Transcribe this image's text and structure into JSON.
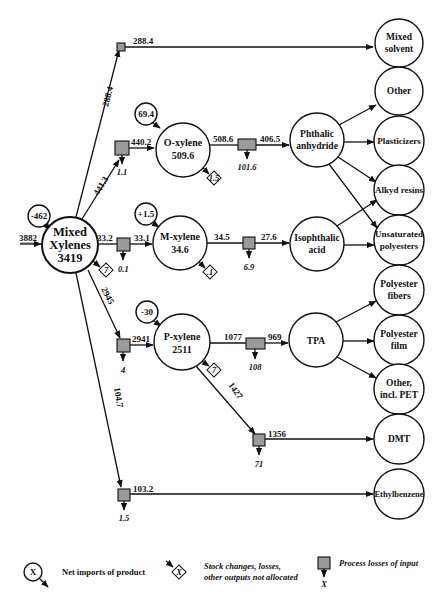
{
  "source_node": {
    "label_line1": "Mixed",
    "label_line2": "Xylenes",
    "value": "3419",
    "input": "3882",
    "net_import": "-462",
    "stock_change": "7"
  },
  "isomers": [
    {
      "name": "O-xylene",
      "value": "509.6",
      "net_import": "69.4",
      "inflow": "441.3",
      "after_loss": "440.2",
      "loss": "1.1",
      "stock_change": "1.5",
      "outflow": "508.6",
      "after_outflow_loss": "406.5",
      "outflow_loss": "101.6"
    },
    {
      "name": "M-xylene",
      "value": "34.6",
      "net_import": "+1.5",
      "inflow": "33.2",
      "after_loss": "33.1",
      "loss": "0.1",
      "stock_change": ".1",
      "outflow": "34.5",
      "after_outflow_loss": "27.6",
      "outflow_loss": "6.9"
    },
    {
      "name": "P-xylene",
      "value": "2511",
      "net_import": "-30",
      "inflow": "2945",
      "after_loss": "2941",
      "loss": "4",
      "stock_change": "7",
      "outflow": "1077",
      "after_outflow_loss": "969",
      "outflow_loss": "108",
      "outflow2": "1427",
      "after_outflow2_loss": "1356",
      "outflow2_loss": "71"
    }
  ],
  "direct_flows": {
    "mixed_solvent": {
      "flow": "288.4",
      "after_loss": "288.4"
    },
    "ethylbenzene": {
      "flow": "104.7",
      "after_loss": "103.2",
      "loss": "1.5"
    }
  },
  "intermediates": {
    "phthalic": {
      "line1": "Phthalic",
      "line2": "anhydride"
    },
    "isophthalic": {
      "line1": "Isophthalic",
      "line2": "acid"
    },
    "tpa": {
      "line1": "TPA"
    }
  },
  "end_uses": [
    {
      "line1": "Mixed",
      "line2": "solvent"
    },
    {
      "line1": "Other",
      "line2": ""
    },
    {
      "line1": "Plasticizers",
      "line2": ""
    },
    {
      "line1": "Alkyd resins",
      "line2": ""
    },
    {
      "line1": "Unsaturated",
      "line2": "polyesters"
    },
    {
      "line1": "Polyester",
      "line2": "fibers"
    },
    {
      "line1": "Polyester",
      "line2": "film"
    },
    {
      "line1": "Other,",
      "line2": "incl. PET"
    },
    {
      "line1": "DMT",
      "line2": ""
    },
    {
      "line1": "Ethylbenzene",
      "line2": ""
    }
  ],
  "legend": {
    "net_imports": {
      "symbol": "X",
      "label": "Net imports of product"
    },
    "stock_changes": {
      "symbol": "X",
      "label_line1": "Stock changes, losses,",
      "label_line2": "other outputs not allocated"
    },
    "process_losses": {
      "symbol": "X",
      "label": "Process losses of input"
    }
  },
  "colors": {
    "box_fill": "#9a9a9a",
    "line": "#111111",
    "background": "#ffffff"
  }
}
